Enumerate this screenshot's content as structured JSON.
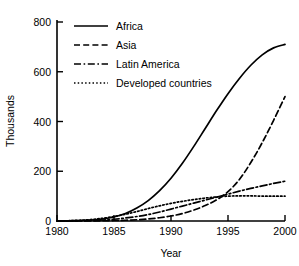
{
  "chart_data": {
    "type": "line",
    "title": "",
    "xlabel": "Year",
    "ylabel": "Thousands",
    "xlim": [
      1980,
      2000
    ],
    "ylim": [
      0,
      800
    ],
    "grid": false,
    "legend_position": "top-left",
    "xticks": [
      "1980",
      "1985",
      "1990",
      "1995",
      "2000"
    ],
    "xtick_values": [
      1980,
      1985,
      1990,
      1995,
      2000
    ],
    "yticks": [
      "0",
      "200",
      "400",
      "600",
      "800"
    ],
    "ytick_values": [
      0,
      200,
      400,
      600,
      800
    ],
    "x": [
      1980,
      1981,
      1982,
      1983,
      1984,
      1985,
      1986,
      1987,
      1988,
      1989,
      1990,
      1991,
      1992,
      1993,
      1994,
      1995,
      1996,
      1997,
      1998,
      1999,
      2000
    ],
    "series": [
      {
        "name": "Africa",
        "linestyle": "solid",
        "color": "#000000",
        "values": [
          0,
          1,
          2,
          4,
          8,
          16,
          30,
          52,
          82,
          122,
          172,
          232,
          300,
          372,
          444,
          512,
          573,
          626,
          668,
          696,
          710
        ]
      },
      {
        "name": "Asia",
        "linestyle": "dashed",
        "color": "#000000",
        "values": [
          0,
          0,
          0,
          0,
          1,
          2,
          3,
          5,
          8,
          13,
          20,
          30,
          44,
          62,
          85,
          118,
          167,
          235,
          315,
          405,
          500
        ]
      },
      {
        "name": "Latin America",
        "linestyle": "dashdot",
        "color": "#000000",
        "values": [
          0,
          0,
          1,
          2,
          4,
          7,
          12,
          18,
          26,
          36,
          48,
          60,
          72,
          84,
          96,
          108,
          120,
          131,
          141,
          151,
          160
        ]
      },
      {
        "name": "Developed countries",
        "linestyle": "dotted",
        "color": "#000000",
        "values": [
          0,
          1,
          3,
          6,
          11,
          18,
          27,
          38,
          50,
          61,
          71,
          79,
          86,
          92,
          97,
          100,
          101,
          101,
          100,
          100,
          100
        ]
      }
    ]
  },
  "legend": {
    "items": [
      {
        "label": "Africa",
        "style": "solid"
      },
      {
        "label": "Asia",
        "style": "dashed"
      },
      {
        "label": "Latin America",
        "style": "dashdot"
      },
      {
        "label": "Developed countries",
        "style": "dotted"
      }
    ]
  }
}
